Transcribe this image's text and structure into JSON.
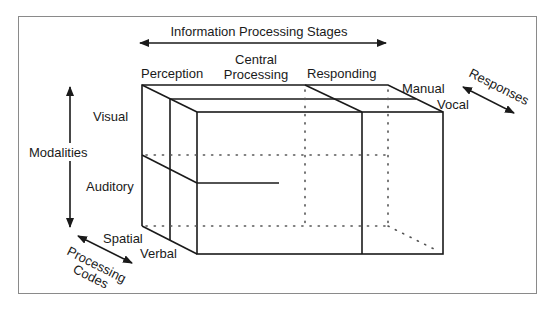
{
  "diagram": {
    "type": "3d-cube-model",
    "axes": {
      "stages": {
        "title": "Information Processing Stages",
        "items": [
          "Perception",
          "Central",
          "Processing",
          "Responding"
        ]
      },
      "modalities": {
        "title": "Modalities",
        "items": [
          "Visual",
          "Auditory"
        ]
      },
      "codes": {
        "title_line1": "Processing",
        "title_line2": "Codes",
        "items": [
          "Spatial",
          "Verbal"
        ]
      },
      "responses": {
        "title": "Responses",
        "items": [
          "Manual",
          "Vocal"
        ]
      }
    },
    "colors": {
      "line": "#1a1a1a",
      "frame": "#8a8a8a",
      "dots": "#555555"
    }
  }
}
